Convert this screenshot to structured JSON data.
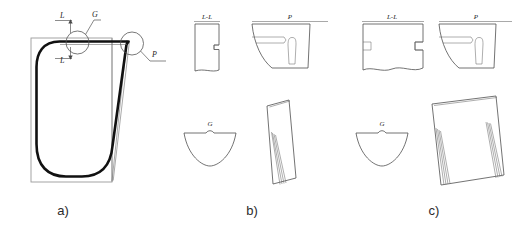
{
  "figure": {
    "background": "#ffffff",
    "line_color": "#1a1a1a",
    "hatch_color": "#3a3a3a",
    "frame_color": "#9a9a9a"
  },
  "panels": [
    {
      "id": "a",
      "caption": "a)",
      "type": "overall-outline",
      "callouts": [
        {
          "name": "G",
          "label": "G",
          "shape": "circle-detail"
        },
        {
          "name": "P",
          "label": "P",
          "shape": "circle-detail"
        }
      ],
      "section_marks": [
        {
          "label": "L",
          "position": "upper"
        },
        {
          "label": "L",
          "position": "lower"
        }
      ]
    },
    {
      "id": "b",
      "caption": "b)",
      "type": "section-views-narrow",
      "views": [
        {
          "name": "section-ll",
          "label": "L-L",
          "hatched": true,
          "width": "narrow"
        },
        {
          "name": "view-p",
          "label": "P",
          "hatched": false
        },
        {
          "name": "detail-g",
          "label": "G",
          "hatched": false
        },
        {
          "name": "tilted-strip",
          "label": "",
          "hatched": true,
          "width": "narrow"
        }
      ]
    },
    {
      "id": "c",
      "caption": "c)",
      "type": "section-views-wide",
      "views": [
        {
          "name": "section-ll",
          "label": "L-L",
          "hatched": true,
          "width": "wide"
        },
        {
          "name": "view-p",
          "label": "P",
          "hatched": false
        },
        {
          "name": "detail-g",
          "label": "G",
          "hatched": false
        },
        {
          "name": "tilted-strip",
          "label": "",
          "hatched": true,
          "width": "wide"
        }
      ]
    }
  ],
  "labels": {
    "caption_a": "a)",
    "caption_b": "b)",
    "caption_c": "c)",
    "G": "G",
    "P": "P",
    "L": "L",
    "LL": "L-L"
  }
}
